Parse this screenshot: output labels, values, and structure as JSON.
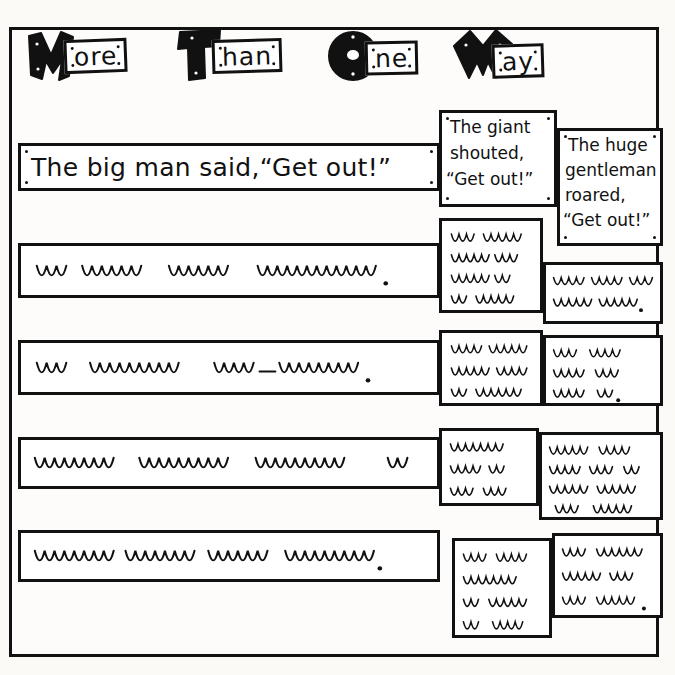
{
  "page": {
    "title_text": "More Than One Way",
    "ink_color": "#111111",
    "paper_color": "#fdfcfa"
  },
  "title": {
    "words": [
      {
        "cap": "M",
        "rest": "ore",
        "cap_style": "jagged-m"
      },
      {
        "cap": "T",
        "rest": "han",
        "cap_style": "block-t"
      },
      {
        "cap": "O",
        "rest": "ne",
        "cap_style": "circle-o"
      },
      {
        "cap": "W",
        "rest": "ay",
        "cap_style": "zigzag-w"
      }
    ]
  },
  "rows": [
    {
      "id": "row-1",
      "main": {
        "kind": "text",
        "value": "The big man said,“Get out!”"
      },
      "middle": {
        "kind": "text",
        "value": "The giant shouted, “Get out!”",
        "lines": [
          "The giant",
          "shouted,",
          "“Get out!”"
        ]
      },
      "right": {
        "kind": "text",
        "value": "The huge gentleman roared, “Get out!”",
        "lines": [
          "The huge",
          "gentleman",
          "roared,",
          "“Get out!”"
        ]
      }
    },
    {
      "id": "row-2",
      "main": {
        "kind": "squiggle",
        "groups": [
          3,
          6,
          12
        ],
        "terminator": "period"
      },
      "middle": {
        "kind": "squiggle",
        "lines": [
          [
            3,
            5
          ],
          [
            5,
            3
          ],
          [
            5,
            2
          ],
          [
            2,
            5
          ]
        ]
      },
      "right": {
        "kind": "squiggle",
        "lines": [
          [
            4,
            4,
            3
          ],
          [
            5,
            5
          ]
        ],
        "terminator": "period"
      }
    },
    {
      "id": "row-3",
      "main": {
        "kind": "squiggle",
        "groups": [
          3,
          9
        ],
        "hyphen_group": [
          4,
          8
        ],
        "terminator": "period"
      },
      "middle": {
        "kind": "squiggle",
        "lines": [
          [
            4,
            5
          ],
          [
            5,
            4
          ],
          [
            2,
            6
          ]
        ]
      },
      "right": {
        "kind": "squiggle",
        "lines": [
          [
            3,
            4
          ],
          [
            4,
            3
          ],
          [
            4,
            2
          ]
        ],
        "terminator": "period"
      }
    },
    {
      "id": "row-4",
      "main": {
        "kind": "squiggle",
        "groups": [
          8,
          9,
          9,
          2
        ]
      },
      "middle": {
        "kind": "squiggle",
        "lines": [
          [
            7
          ],
          [
            4,
            2
          ],
          [
            3,
            3
          ]
        ]
      },
      "right": {
        "kind": "squiggle",
        "lines": [
          [
            5,
            4
          ],
          [
            4,
            3,
            2
          ],
          [
            5,
            5
          ],
          [
            3,
            5
          ]
        ]
      }
    },
    {
      "id": "row-5",
      "main": {
        "kind": "squiggle",
        "groups": [
          8,
          7,
          6,
          9
        ],
        "terminator": "period"
      },
      "middle": {
        "kind": "squiggle",
        "lines": [
          [
            3,
            4
          ],
          [
            7
          ],
          [
            2,
            5
          ],
          [
            2,
            4
          ]
        ]
      },
      "right": {
        "kind": "squiggle",
        "lines": [
          [
            3,
            6
          ],
          [
            5,
            3
          ],
          [
            3,
            5
          ]
        ],
        "terminator": "period"
      }
    }
  ]
}
